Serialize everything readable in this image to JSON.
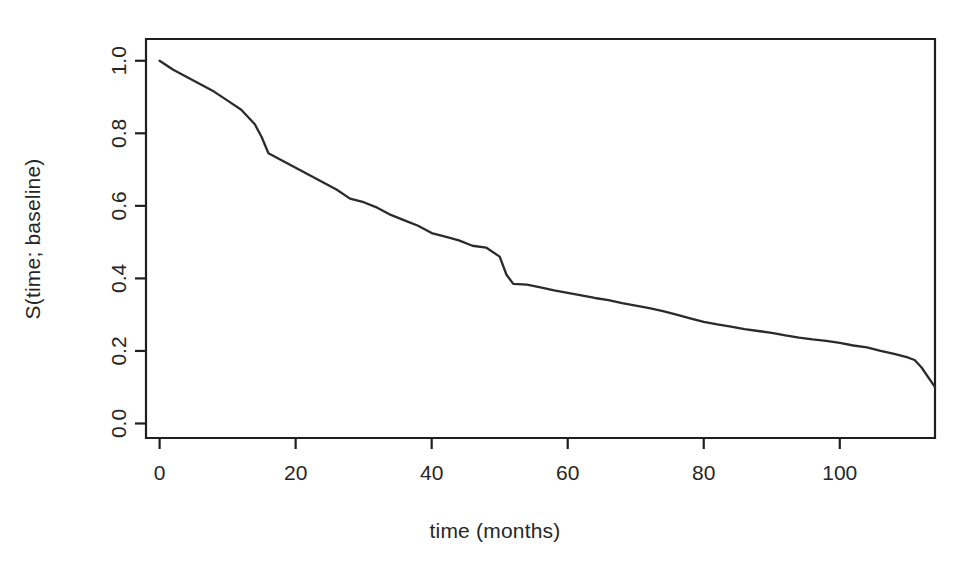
{
  "chart_data": {
    "type": "line",
    "title": "",
    "subtitle": "",
    "xlabel": "time (months)",
    "ylabel": "S(time; baseline)",
    "xlim": [
      -2,
      114
    ],
    "ylim": [
      -0.04,
      1.06
    ],
    "xticks": [
      0,
      20,
      40,
      60,
      80,
      100
    ],
    "xticklabels": [
      "0",
      "20",
      "40",
      "60",
      "80",
      "100"
    ],
    "yticks": [
      0.0,
      0.2,
      0.4,
      0.6,
      0.8,
      1.0
    ],
    "yticklabels": [
      "0.0",
      "0.2",
      "0.4",
      "0.6",
      "0.8",
      "1.0"
    ],
    "grid": false,
    "legend": null,
    "legend_position": "none",
    "series": [
      {
        "name": "baseline survival",
        "color": "#2b2b2b",
        "x": [
          0,
          2,
          4,
          6,
          8,
          10,
          12,
          14,
          15,
          16,
          18,
          20,
          22,
          24,
          26,
          28,
          30,
          32,
          34,
          36,
          38,
          40,
          42,
          44,
          46,
          48,
          50,
          51,
          52,
          54,
          56,
          58,
          60,
          62,
          64,
          66,
          68,
          70,
          72,
          74,
          76,
          78,
          80,
          82,
          84,
          86,
          88,
          90,
          92,
          94,
          96,
          98,
          100,
          102,
          104,
          106,
          108,
          110,
          111,
          112,
          114
        ],
        "y": [
          1.0,
          0.975,
          0.955,
          0.935,
          0.915,
          0.89,
          0.865,
          0.825,
          0.79,
          0.745,
          0.725,
          0.705,
          0.685,
          0.665,
          0.645,
          0.62,
          0.61,
          0.595,
          0.575,
          0.56,
          0.545,
          0.525,
          0.515,
          0.505,
          0.49,
          0.485,
          0.46,
          0.41,
          0.385,
          0.383,
          0.375,
          0.367,
          0.36,
          0.353,
          0.346,
          0.34,
          0.332,
          0.325,
          0.318,
          0.31,
          0.3,
          0.29,
          0.28,
          0.273,
          0.267,
          0.26,
          0.255,
          0.25,
          0.243,
          0.237,
          0.232,
          0.228,
          0.222,
          0.215,
          0.21,
          0.2,
          0.192,
          0.182,
          0.175,
          0.155,
          0.1
        ]
      }
    ]
  },
  "chart": {
    "axis": {
      "x_title": "time (months)",
      "y_title": "S(time; baseline)"
    }
  }
}
